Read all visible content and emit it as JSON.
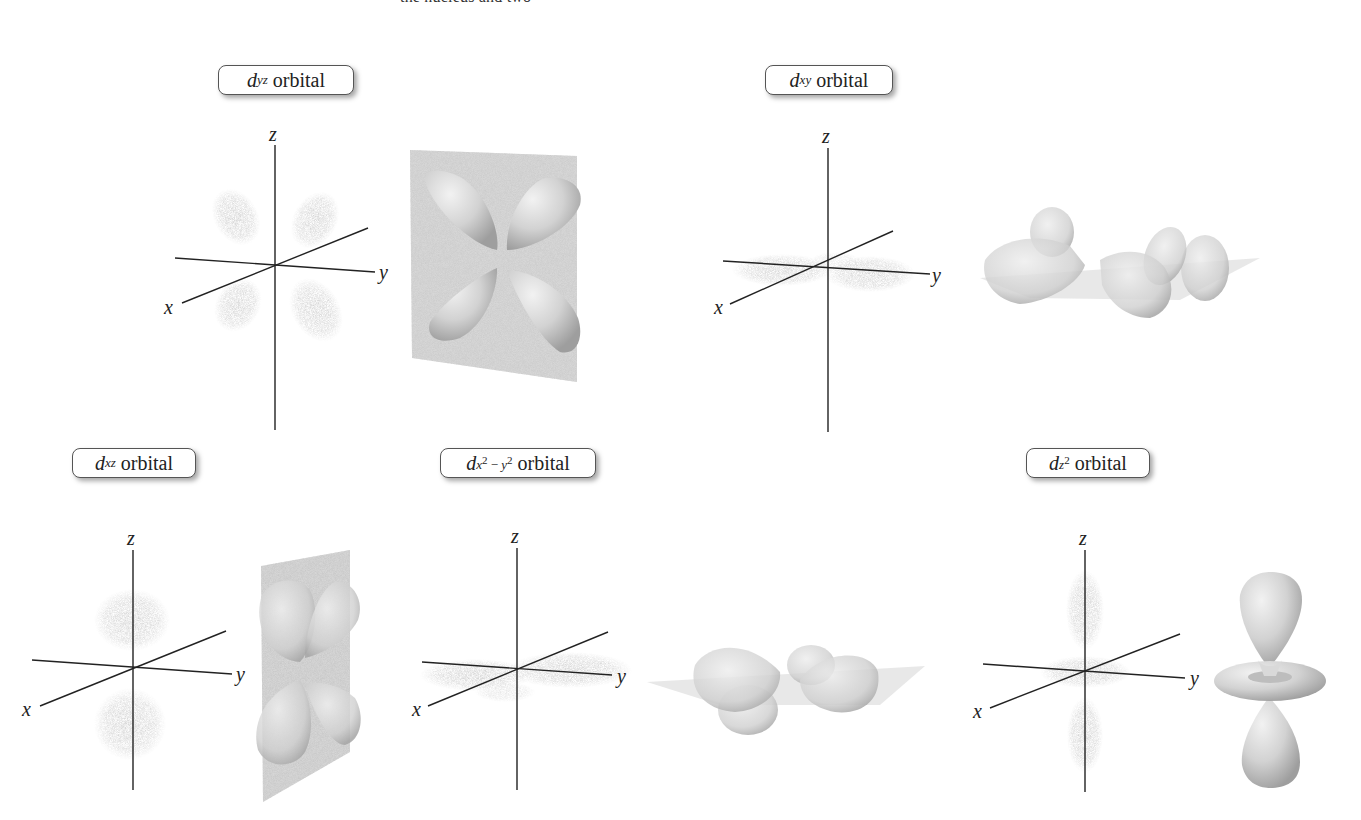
{
  "page": {
    "cut_off_text": "the nucleus and two"
  },
  "orbitals": [
    {
      "id": "dyz",
      "symbol": "d",
      "subscript": "yz",
      "word": "orbital"
    },
    {
      "id": "dxy",
      "symbol": "d",
      "subscript": "xy",
      "word": "orbital"
    },
    {
      "id": "dxz",
      "symbol": "d",
      "subscript": "xz",
      "word": "orbital"
    },
    {
      "id": "dx2y2",
      "symbol": "d",
      "subscript_x": "x",
      "subscript_sup1": "2",
      "subscript_minus": " − ",
      "subscript_y": "y",
      "subscript_sup2": "2",
      "word": "orbital"
    },
    {
      "id": "dz2",
      "symbol": "d",
      "subscript_z": "z",
      "subscript_sup": "2",
      "word": "orbital"
    }
  ],
  "axes": {
    "x": "x",
    "y": "y",
    "z": "z"
  },
  "colors": {
    "axis": "#222222",
    "cloud": "#9a9a9a",
    "lobe": "#d4d4d4",
    "plane": "#c8c8c8"
  }
}
